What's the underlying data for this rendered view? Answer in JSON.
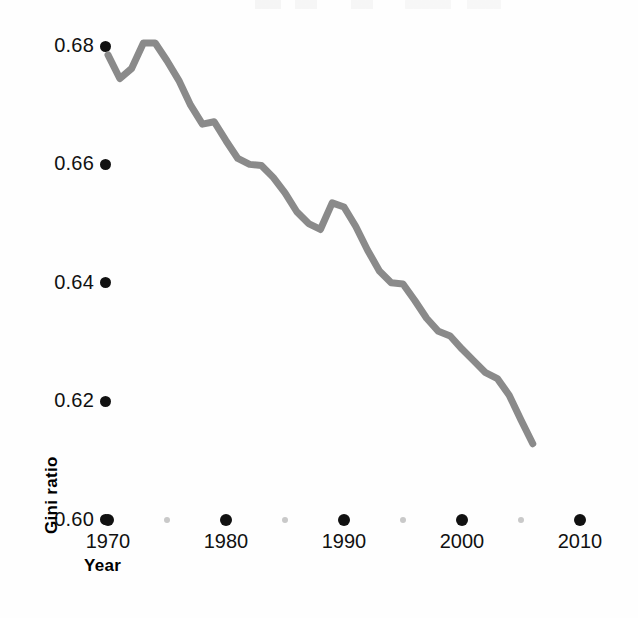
{
  "chart_data": {
    "type": "line",
    "title": "",
    "xlabel": "Year",
    "ylabel": "Gini ratio",
    "xlim": [
      1970,
      2010
    ],
    "ylim": [
      0.6,
      0.685
    ],
    "grid": false,
    "legend": null,
    "line_color": "#8a8a8a",
    "line_width": 7,
    "tick_color": "#111111",
    "minor_tick_color": "#c9c9c9",
    "y_ticks": [
      0.6,
      0.62,
      0.64,
      0.66,
      0.68
    ],
    "y_tick_labels": [
      "0.60",
      "0.62",
      "0.64",
      "0.66",
      "0.68"
    ],
    "x_ticks": [
      1970,
      1980,
      1990,
      2000,
      2010
    ],
    "x_tick_labels": [
      "1970",
      "1980",
      "1990",
      "2000",
      "2010"
    ],
    "x_minor_ticks": [
      1975,
      1985,
      1995,
      2005
    ],
    "series": [
      {
        "name": "Gini ratio",
        "x": [
          1970,
          1971,
          1972,
          1973,
          1974,
          1975,
          1976,
          1977,
          1978,
          1979,
          1980,
          1981,
          1982,
          1983,
          1984,
          1985,
          1986,
          1987,
          1988,
          1989,
          1990,
          1991,
          1992,
          1993,
          1994,
          1995,
          1996,
          1997,
          1998,
          1999,
          2000,
          2001,
          2002,
          2003,
          2004,
          2005,
          2006
        ],
        "y": [
          0.6785,
          0.6745,
          0.6762,
          0.6805,
          0.6805,
          0.6775,
          0.6742,
          0.67,
          0.6668,
          0.6672,
          0.664,
          0.661,
          0.66,
          0.6598,
          0.6578,
          0.6552,
          0.652,
          0.65,
          0.649,
          0.6535,
          0.6528,
          0.6495,
          0.6455,
          0.642,
          0.64,
          0.6398,
          0.637,
          0.634,
          0.6318,
          0.631,
          0.6288,
          0.6268,
          0.6248,
          0.6238,
          0.621,
          0.6168,
          0.6128
        ]
      }
    ]
  },
  "axes": {
    "y_title": "Gini ratio",
    "x_title": "Year"
  }
}
